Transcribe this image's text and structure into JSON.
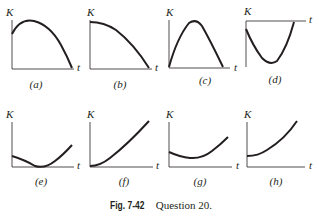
{
  "figure": {
    "caption_number": "Fig. 7-42",
    "caption_text": "Question 20.",
    "y_axis_label": "K",
    "x_axis_label": "t",
    "panels": [
      {
        "id": "a",
        "label": "(a)",
        "shape": "starts positive, rises to max, falls to zero"
      },
      {
        "id": "b",
        "label": "(b)",
        "shape": "starts at max, decreases to zero"
      },
      {
        "id": "c",
        "label": "(c)",
        "shape": "starts at zero, rises to max, falls to zero"
      },
      {
        "id": "d",
        "label": "(d)",
        "shape": "t-axis at top, dips below zero and returns"
      },
      {
        "id": "e",
        "label": "(e)",
        "shape": "starts positive, decreases to zero, increases"
      },
      {
        "id": "f",
        "label": "(f)",
        "shape": "starts at zero, increases"
      },
      {
        "id": "g",
        "label": "(g)",
        "shape": "starts positive, decreases to min, increases"
      },
      {
        "id": "h",
        "label": "(h)",
        "shape": "starts positive, increases"
      }
    ]
  }
}
